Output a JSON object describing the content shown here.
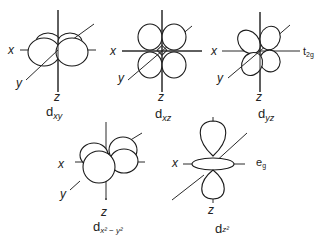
{
  "diagram": {
    "orbitals": [
      {
        "id": "dxy",
        "label_main": "d",
        "label_sub": "xy",
        "axes": {
          "x": "x",
          "y": "y",
          "z": "z"
        }
      },
      {
        "id": "dxz",
        "label_main": "d",
        "label_sub": "xz",
        "axes": {
          "x": "x",
          "y": "y",
          "z": "z"
        }
      },
      {
        "id": "dyz",
        "label_main": "d",
        "label_sub": "yz",
        "axes": {
          "x": "x",
          "y": "y",
          "z": "z"
        }
      },
      {
        "id": "dx2y2",
        "label_main": "d",
        "label_sub": "x² − y²",
        "axes": {
          "x": "x",
          "y": "y",
          "z": "z"
        }
      },
      {
        "id": "dz2",
        "label_main": "d",
        "label_sub": "z²",
        "axes": {
          "x": "x",
          "y": "y",
          "z": "z"
        }
      }
    ],
    "groups": [
      {
        "label_main": "t",
        "label_sub": "2g"
      },
      {
        "label_main": "e",
        "label_sub": "g"
      }
    ],
    "colors": {
      "line": "#1a1a1a",
      "background": "#ffffff"
    }
  }
}
